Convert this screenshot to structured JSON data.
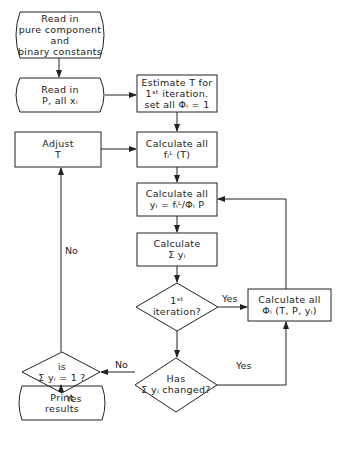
{
  "nodes": {
    "read_constants": {
      "shape": "terminal",
      "lines": [
        "Read in",
        "pure component",
        "and",
        "binary constants"
      ]
    },
    "read_p_x": {
      "shape": "terminal",
      "lines": [
        "Read in",
        "P, all xᵢ"
      ]
    },
    "estimate_t": {
      "shape": "process",
      "lines": [
        "Estimate T for",
        "1ˢᵗ iteration.",
        "set all Φᵢ = 1"
      ]
    },
    "adjust_t": {
      "shape": "process",
      "lines": [
        "Adjust",
        "T"
      ]
    },
    "calc_f": {
      "shape": "process",
      "lines": [
        "Calculate all",
        "fᵢᴸ (T)"
      ]
    },
    "calc_y": {
      "shape": "process",
      "lines": [
        "Calculate all",
        "yᵢ = fᵢᴸ/Φᵢ P"
      ]
    },
    "calc_sum": {
      "shape": "process",
      "lines": [
        "Calculate",
        "Σ yᵢ"
      ]
    },
    "first_iter": {
      "shape": "decision",
      "lines": [
        "1ˢᵗ",
        "iteration?"
      ]
    },
    "calc_phi": {
      "shape": "process",
      "lines": [
        "Calculate all",
        "Φᵢ (T, P, yᵢ)"
      ]
    },
    "has_changed": {
      "shape": "decision",
      "lines": [
        "Has",
        "Σ yᵢ changed?"
      ]
    },
    "is_sum_one": {
      "shape": "decision",
      "lines": [
        "is",
        "Σ yᵢ = 1 ?"
      ]
    },
    "print_results": {
      "shape": "terminal",
      "lines": [
        "Print",
        "results"
      ]
    }
  },
  "edge_labels": {
    "first_iter_yes": "Yes",
    "has_changed_yes": "Yes",
    "has_changed_no": "No",
    "is_sum_one_no": "No",
    "is_sum_one_yes": "Yes"
  }
}
